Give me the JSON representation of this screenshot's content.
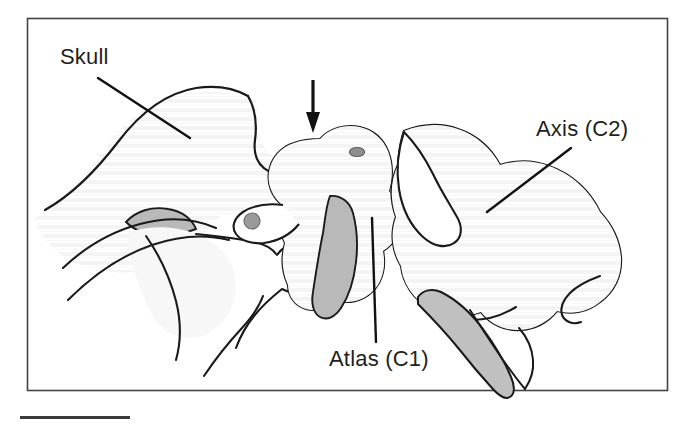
{
  "figure": {
    "kind": "anatomical-line-drawing",
    "background_color": "#ffffff",
    "frame": {
      "name": "figure-border",
      "color": "#444444",
      "x": 27,
      "y": 18,
      "width": 641,
      "height": 373
    },
    "scale_bar": {
      "name": "scale-bar",
      "color": "#3a3a3a",
      "x": 20,
      "y": 416,
      "width": 110,
      "height": 3
    },
    "labels": [
      {
        "id": "skull",
        "text": "Skull",
        "x": 60,
        "y": 44,
        "leader": {
          "x1": 98,
          "y1": 78,
          "x2": 190,
          "y2": 138
        }
      },
      {
        "id": "axis",
        "text": "Axis (C2)",
        "x": 536,
        "y": 116,
        "leader": {
          "x1": 571,
          "y1": 148,
          "x2": 487,
          "y2": 212
        }
      },
      {
        "id": "atlas",
        "text": "Atlas (C1)",
        "x": 329,
        "y": 346,
        "leader": {
          "x1": 376,
          "y1": 342,
          "x2": 372,
          "y2": 218
        }
      }
    ],
    "pointer_arrow": {
      "name": "anterior-arch-arrow",
      "direction": "down",
      "color": "#111111",
      "shaft_x": 313,
      "shaft_top_y": 80,
      "tip_y": 132,
      "points_at": "atlanto-occipital junction"
    },
    "markers": [
      {
        "name": "foramen-marker-posterior",
        "cx": 252,
        "cy": 221,
        "rx": 8,
        "ry": 8,
        "fill": "#9a9a9a"
      },
      {
        "name": "foramen-marker-atlas",
        "cx": 357,
        "cy": 152,
        "rx": 7.5,
        "ry": 4.5,
        "fill": "#8f8f8f"
      }
    ],
    "bone_regions": [
      {
        "name": "skull-base",
        "fill": "#f3f3f3",
        "stroke": "#1a1a1a"
      },
      {
        "name": "mandible-ghost",
        "fill": "#f7f7f7",
        "stroke": "#1a1a1a"
      },
      {
        "name": "atlas-c1",
        "fill": "#c9c9c9",
        "stroke": "#1a1a1a"
      },
      {
        "name": "axis-c2",
        "fill": "#cfcfcf",
        "stroke": "#1a1a1a"
      },
      {
        "name": "axis-spinous-process",
        "fill": "#bdbdbd",
        "stroke": "#1a1a1a"
      },
      {
        "name": "mastoid-shadow",
        "fill": "#b8b8b8",
        "stroke": "#1a1a1a"
      }
    ],
    "colors": {
      "outline": "#1a1a1a",
      "light_bone": "#f3f3f3",
      "mid_bone": "#cfcfcf",
      "dark_bone": "#b8b8b8",
      "label_text": "#231f20",
      "frame": "#444444"
    }
  }
}
